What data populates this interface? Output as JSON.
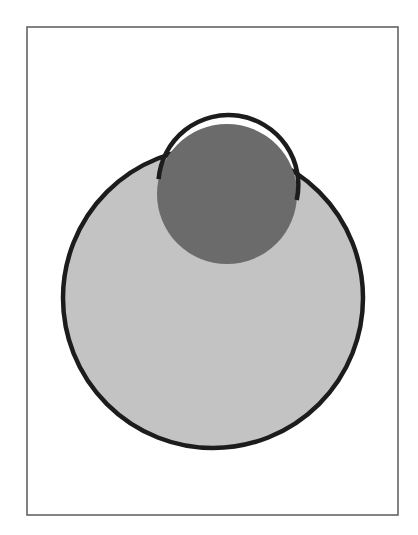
{
  "figure": {
    "frame": {
      "x": 27,
      "y": 27,
      "width": 371,
      "height": 488,
      "stroke": "#5a5a5a",
      "stroke_width": 1.5
    },
    "large_circle": {
      "cx": 213,
      "cy": 298,
      "r": 150,
      "fill": "#c3c3c3",
      "stroke": "#1c1c1c",
      "stroke_width": 4.5
    },
    "small_circle": {
      "cx": 227,
      "cy": 194,
      "r": 70,
      "fill": "#6b6b6b",
      "stroke": "#1c1c1c",
      "stroke_width": 4.5,
      "arc_start": {
        "x": 158,
        "y": 179
      },
      "arc_end": {
        "x": 297,
        "y": 200
      }
    },
    "colors": {
      "background": "#ffffff",
      "light_gray": "#c3c3c3",
      "dark_gray": "#6b6b6b",
      "outline": "#1c1c1c"
    }
  }
}
